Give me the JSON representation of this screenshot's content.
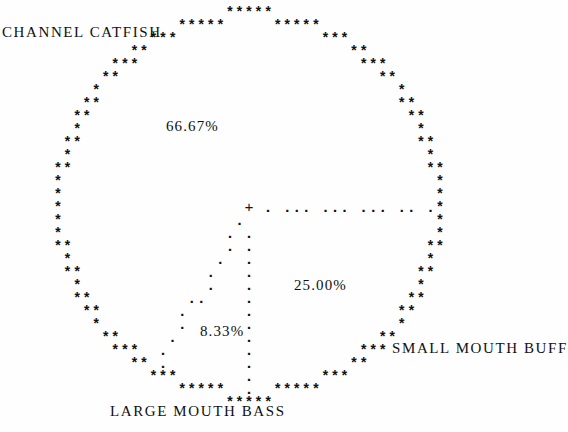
{
  "title": "",
  "colors": {
    "background": "#fefefe",
    "ink": "#111111"
  },
  "labels": {
    "left": "CHANNEL CATFISH",
    "right": "SMALL MOUTH BUFF",
    "bottom": "LARGE MOUTH BASS"
  },
  "percent_labels": {
    "slice_a": "66.67%",
    "slice_b": "25.00%",
    "slice_c": "8.33%"
  },
  "glyphs": {
    "perimeter": "*",
    "radius": ".",
    "center": "+"
  },
  "geometry": {
    "center_x": 249,
    "center_y": 208,
    "radius_x": 190,
    "radius_y": 190,
    "perimeter_steps": 132,
    "radius_dot_spacing": 13
  },
  "chart_data": {
    "type": "pie",
    "title": "",
    "subtitle": "",
    "xlabel": "",
    "ylabel": "",
    "grid": false,
    "legend_position": "around-plot",
    "style": "ascii-line-printer",
    "categories": [
      "CHANNEL CATFISH",
      "SMALL MOUTH BUFF",
      "LARGE MOUTH BASS"
    ],
    "values": [
      66.67,
      25.0,
      8.33
    ],
    "value_labels": [
      "66.67%",
      "25.00%",
      "8.33%"
    ],
    "slices": [
      {
        "label": "CHANNEL CATFISH",
        "value": 66.67,
        "value_label": "66.67%",
        "start_angle_deg": 0,
        "end_angle_deg": 240,
        "label_anchor": "upper-left",
        "pct_label_x": 166,
        "pct_label_y": 118,
        "label_x": 2,
        "label_y": 24
      },
      {
        "label": "SMALL MOUTH BUFF",
        "value": 25.0,
        "value_label": "25.00%",
        "start_angle_deg": 270,
        "end_angle_deg": 360,
        "label_anchor": "lower-right",
        "pct_label_x": 294,
        "pct_label_y": 277,
        "label_x": 392,
        "label_y": 340
      },
      {
        "label": "LARGE MOUTH BASS",
        "value": 8.33,
        "value_label": "8.33%",
        "start_angle_deg": 240,
        "end_angle_deg": 270,
        "label_anchor": "lower-center",
        "pct_label_x": 200,
        "pct_label_y": 323,
        "label_x": 110,
        "label_y": 403
      }
    ],
    "radii_angles_deg": [
      0,
      240,
      270
    ],
    "total": 100.0
  }
}
